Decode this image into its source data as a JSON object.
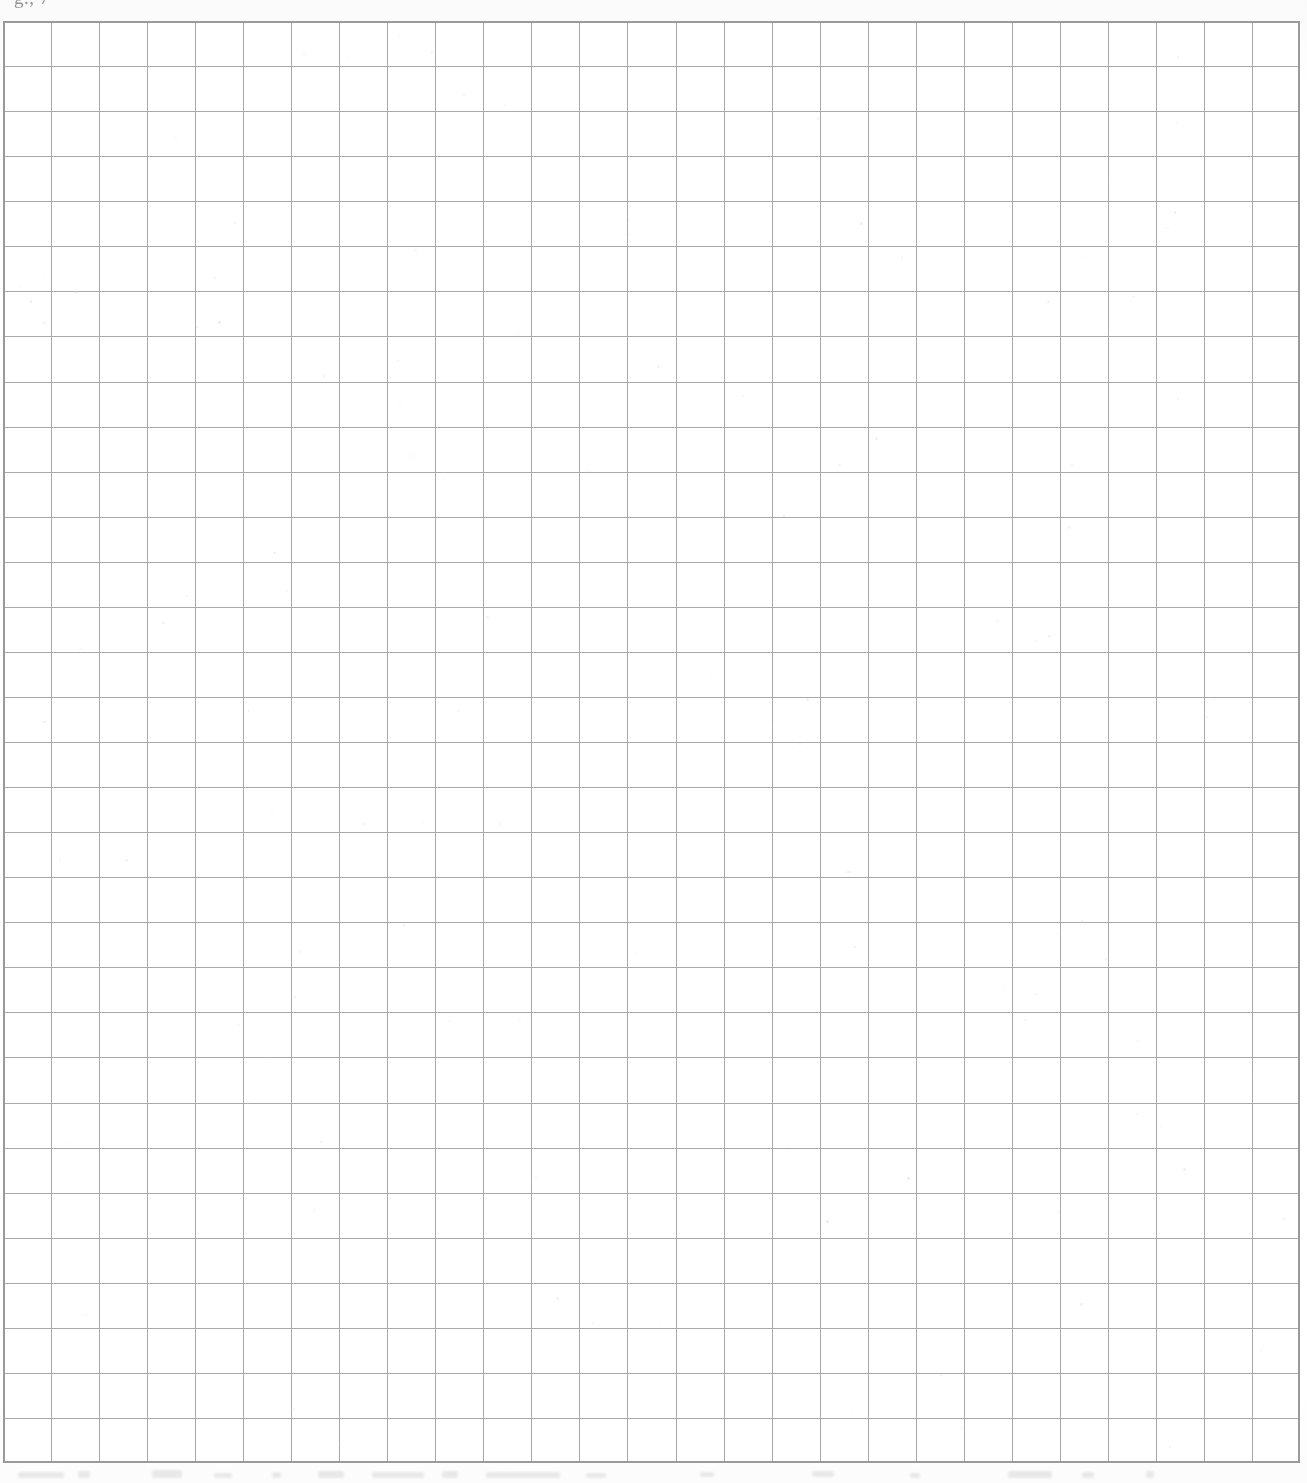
{
  "document": {
    "kind": "scanned-grid-paper",
    "page_background": "#fefefe",
    "header_fragment_text": "g., 7",
    "bottom_artifact_text": ""
  },
  "grid": {
    "columns": 27,
    "rows": 32,
    "cell_width_px": 48,
    "cell_height_px": 45,
    "origin_x_px": 3,
    "origin_y_px": 21,
    "width_px": 1297,
    "height_px": 1442,
    "line_color": "#a9a9a9",
    "border_color": "#9a9a9a",
    "line_width_px": 1.4,
    "border_width_px": 1.8
  },
  "chart_data": {
    "type": "table",
    "title": "",
    "xlabel": "",
    "ylabel": "",
    "categories": [],
    "values": [],
    "grid": true,
    "legend": "none",
    "note": "Blank graph-paper grid: 27 columns by 32 rows, no plotted data."
  }
}
